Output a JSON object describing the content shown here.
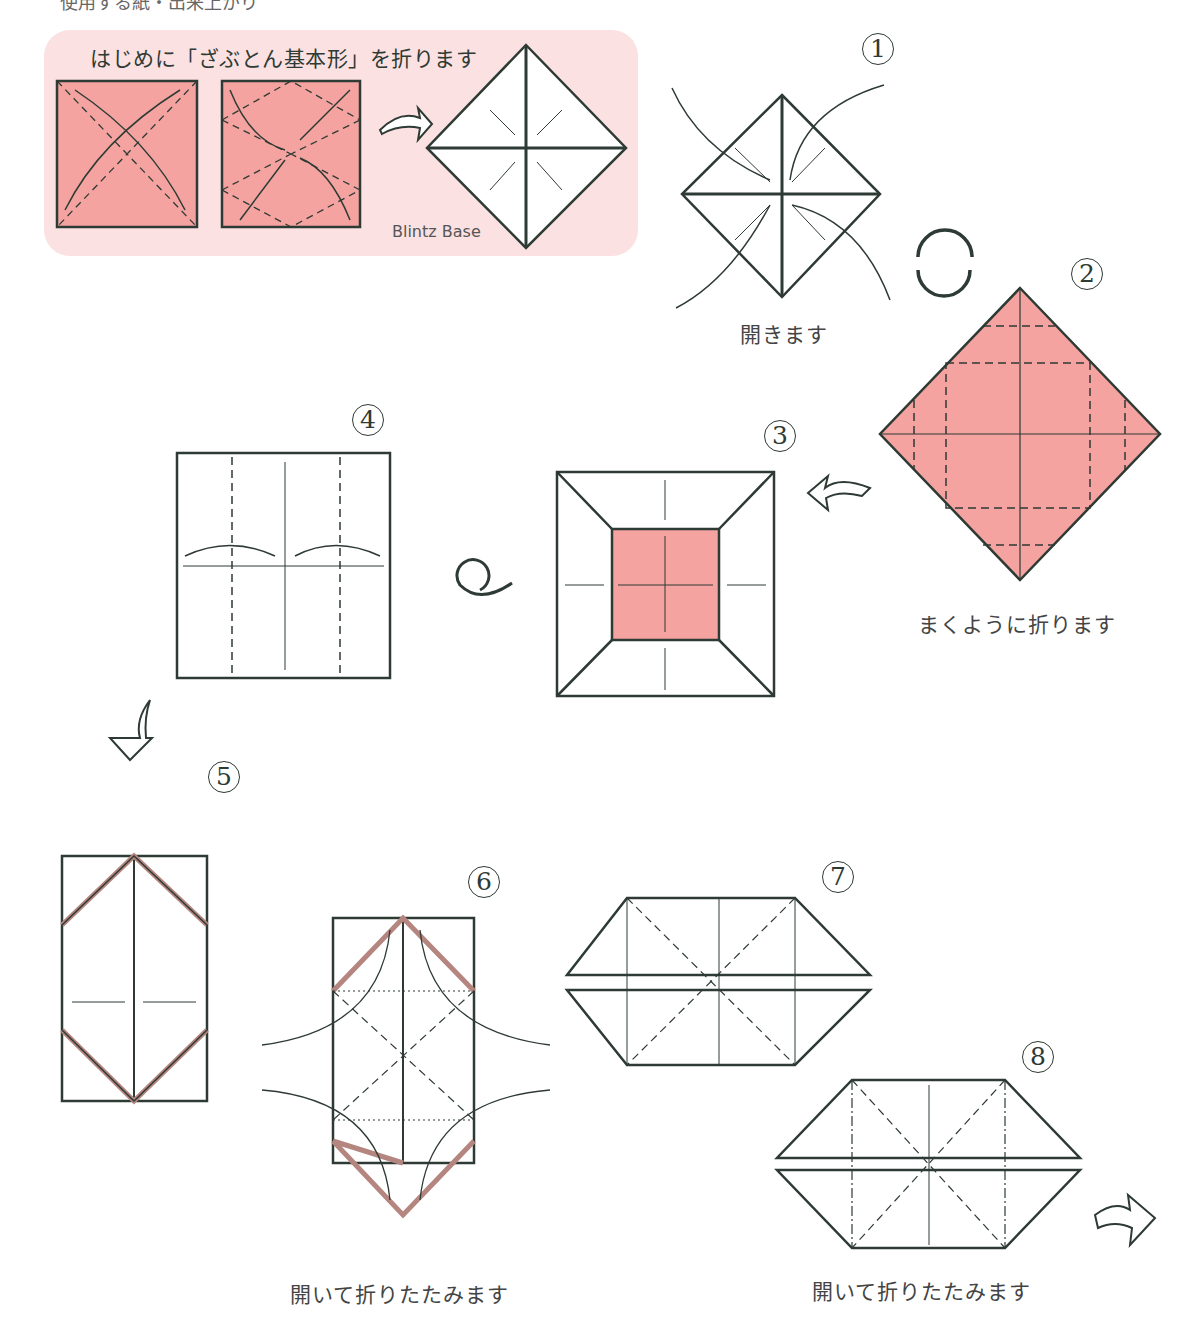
{
  "header": {
    "cut_text": "使用する紙・出来上がり"
  },
  "intro": {
    "title": "はじめに「ざぶとん基本形」を折ります",
    "blintz_label": "Blintz Base"
  },
  "steps": [
    {
      "num": "1",
      "caption": "開きます"
    },
    {
      "num": "2",
      "caption": "まくように折ります"
    },
    {
      "num": "3",
      "caption": ""
    },
    {
      "num": "4",
      "caption": ""
    },
    {
      "num": "5",
      "caption": ""
    },
    {
      "num": "6",
      "caption": "開いて折りたたみます"
    },
    {
      "num": "7",
      "caption": ""
    },
    {
      "num": "8",
      "caption": "開いて折りたたみます"
    }
  ],
  "colors": {
    "paper_pink": "#f4a3a0",
    "panel_pink": "#fbe1e1",
    "line": "#2e3a34"
  }
}
